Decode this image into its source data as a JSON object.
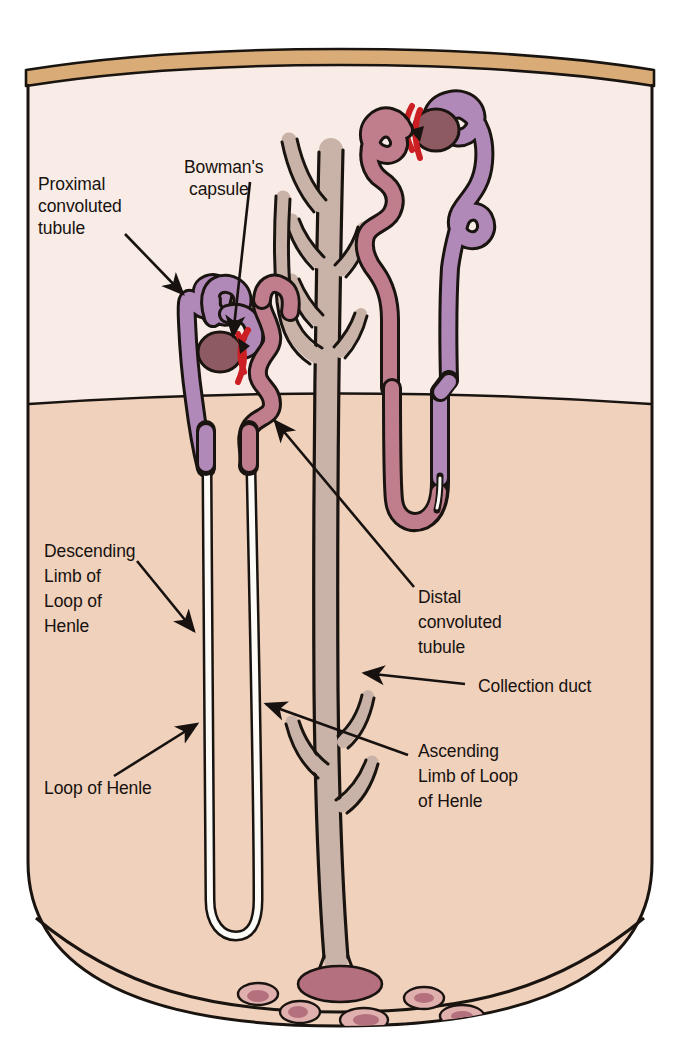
{
  "figure": {
    "width": 679,
    "height": 1056,
    "background": "#ffffff"
  },
  "palette": {
    "page_background": "#ffffff",
    "capsule_band": "#d8ab77",
    "cortex": "#f9ece6",
    "medulla": "#f0d1bc",
    "pelvis_fill": "#e9c9b4",
    "outline": "#1a1410",
    "proximal_tubule": "#b089b8",
    "distal_tubule": "#c07e8c",
    "glomerulus": "#8e5a62",
    "arteriole_red": "#cc1f23",
    "collecting_duct": "#c9b3a8",
    "loop_of_henle_lumen": "#fdfbf8",
    "label_text": "#17120f",
    "leader_line": "#17120f"
  },
  "regions": [
    {
      "id": "renal-capsule",
      "name": "Renal capsule band"
    },
    {
      "id": "cortex",
      "name": "Renal cortex"
    },
    {
      "id": "medulla",
      "name": "Renal medulla"
    },
    {
      "id": "pelvis",
      "name": "Renal pelvis / papilla"
    }
  ],
  "labels": [
    {
      "id": "proximal-convoluted-tubule",
      "lines": [
        "Proximal",
        "convoluted",
        "tubule"
      ],
      "x": 38,
      "y": 190,
      "align": "start"
    },
    {
      "id": "bowmans-capsule",
      "lines": [
        "Bowman's",
        "capsule"
      ],
      "x": 184,
      "y": 173,
      "align": "start"
    },
    {
      "id": "descending-limb-of-loop-of-henle",
      "lines": [
        "Descending",
        "Limb of",
        "Loop of",
        "Henle"
      ],
      "x": 44,
      "y": 557,
      "align": "start"
    },
    {
      "id": "loop-of-henle",
      "lines": [
        "Loop of Henle"
      ],
      "x": 44,
      "y": 794,
      "align": "start"
    },
    {
      "id": "distal-convoluted-tubule",
      "lines": [
        "Distal",
        "convoluted",
        "tubule"
      ],
      "x": 418,
      "y": 603,
      "align": "start"
    },
    {
      "id": "collection-duct",
      "lines": [
        "Collection duct"
      ],
      "x": 478,
      "y": 692,
      "align": "start"
    },
    {
      "id": "ascending-limb-of-loop-of-henle",
      "lines": [
        "Ascending",
        "Limb of Loop",
        "of Henle"
      ],
      "x": 418,
      "y": 757,
      "align": "start"
    }
  ],
  "leaders": [
    {
      "id": "leader-proximal-convoluted-tubule",
      "points": "125,234 185,296",
      "arrow_at": "end"
    },
    {
      "id": "leader-bowmans-capsule",
      "points": "250,180 232,338",
      "arrow_at": "end"
    },
    {
      "id": "leader-descending-limb",
      "points": "137,561 196,633",
      "arrow_at": "end"
    },
    {
      "id": "leader-loop-of-henle",
      "points": "114,776 199,723",
      "arrow_at": "end"
    },
    {
      "id": "leader-distal-convoluted-tubule",
      "points": "414,587 273,419",
      "arrow_at": "end"
    },
    {
      "id": "leader-collection-duct",
      "points": "465,684 362,673",
      "arrow_at": "end"
    },
    {
      "id": "leader-ascending-limb",
      "points": "408,755 264,703",
      "arrow_at": "end"
    }
  ],
  "structures": [
    {
      "id": "nephron-left",
      "name": "Left (juxtamedullary) nephron with long loop of Henle"
    },
    {
      "id": "nephron-right",
      "name": "Right (cortical) nephron with short loop of Henle"
    },
    {
      "id": "collecting-duct-tree",
      "name": "Branching collecting duct"
    },
    {
      "id": "glomerulus-left",
      "name": "Left glomerulus inside Bowman's capsule"
    },
    {
      "id": "glomerulus-right",
      "name": "Right glomerulus inside Bowman's capsule"
    },
    {
      "id": "papilla-vessels",
      "name": "Vessels at the renal papilla"
    }
  ],
  "ghost_text": {
    "value": "",
    "note": "faint cropped descenders along the very top edge"
  }
}
